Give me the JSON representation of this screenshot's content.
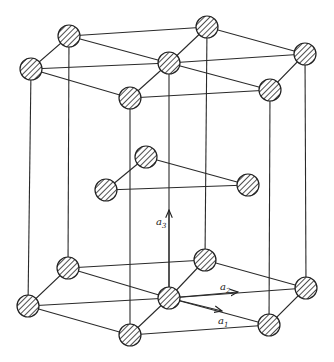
{
  "diagram": {
    "type": "hexagonal close-packed unit cell",
    "labels": {
      "a1": {
        "base": "a",
        "sub": "1"
      },
      "a2": {
        "base": "a",
        "sub": "2"
      },
      "a3": {
        "base": "a",
        "sub": "3"
      }
    },
    "colors": {
      "line": "#2a2a2a",
      "background": "#ffffff"
    }
  }
}
